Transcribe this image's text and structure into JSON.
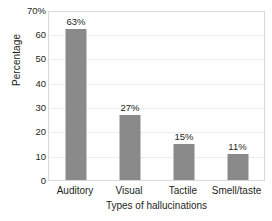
{
  "chart_data": {
    "type": "bar",
    "title": "",
    "categories": [
      "Auditory",
      "Visual",
      "Tactile",
      "Smell/taste"
    ],
    "values": [
      63,
      27,
      15,
      11
    ],
    "data_labels": [
      "63%",
      "27%",
      "15%",
      "11%"
    ],
    "xlabel": "Types of hallucinations",
    "ylabel": "Percentage",
    "ylim": [
      0,
      70
    ],
    "ytick_values": [
      70,
      60,
      50,
      40,
      30,
      20,
      10,
      0
    ],
    "ytick_labels": [
      "70%",
      "60",
      "50",
      "40",
      "30",
      "20",
      "10",
      "0"
    ],
    "grid": true,
    "legend": "none",
    "bar_color": "#8a8a8a",
    "gridline_color": "#ededed",
    "frame_color": "#d9d9d9",
    "background_color": "#ffffff"
  }
}
